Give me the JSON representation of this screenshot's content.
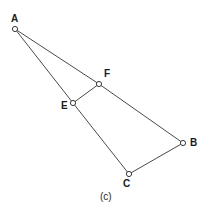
{
  "figure": {
    "caption": "(c)",
    "background_color": "#ffffff",
    "line_color": "#4a4a4a",
    "marker_fill_color": "#ffffff",
    "marker_stroke_color": "#3a3a3a",
    "label_color": "#1a1a1a",
    "width": 207,
    "height": 214
  },
  "vertices": [
    {
      "id": "A",
      "label": "A",
      "x": 15,
      "y": 29,
      "label_x": 11,
      "label_y": 14
    },
    {
      "id": "F",
      "label": "F",
      "x": 99,
      "y": 84,
      "label_x": 104,
      "label_y": 69
    },
    {
      "id": "E",
      "label": "E",
      "x": 73,
      "y": 103,
      "label_x": 61,
      "label_y": 101
    },
    {
      "id": "B",
      "label": "B",
      "x": 183,
      "y": 143,
      "label_x": 190,
      "label_y": 138
    },
    {
      "id": "C",
      "label": "C",
      "x": 129,
      "y": 174,
      "label_x": 123,
      "label_y": 179
    }
  ],
  "edges": [
    {
      "id": "A-F",
      "from": "A",
      "to": "F"
    },
    {
      "id": "A-E",
      "from": "A",
      "to": "E"
    },
    {
      "id": "E-F",
      "from": "E",
      "to": "F"
    },
    {
      "id": "F-B",
      "from": "F",
      "to": "B"
    },
    {
      "id": "B-C",
      "from": "B",
      "to": "C"
    },
    {
      "id": "C-E",
      "from": "C",
      "to": "E"
    }
  ]
}
